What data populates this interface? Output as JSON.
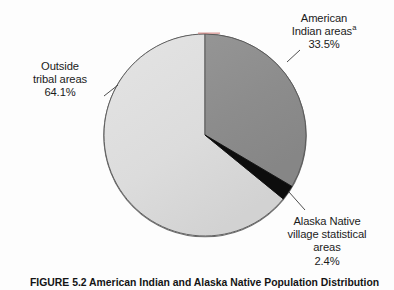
{
  "figure": {
    "caption": "FIGURE 5.2   American Indian and Alaska Native Population Distribution",
    "background_color": "#fdfdfd"
  },
  "chart_data": {
    "type": "pie",
    "title": "",
    "start_angle_deg": 0,
    "direction": "clockwise",
    "center": {
      "x": 205,
      "y": 135
    },
    "radius": 101,
    "categories": [
      "American Indian areasᵃ",
      "Alaska Native village statistical areas",
      "Outside tribal areas"
    ],
    "values": [
      33.5,
      2.4,
      64.1
    ],
    "unit": "%",
    "colors": [
      "#8e8e8e",
      "#0d0d0d",
      "#dcdcdc"
    ],
    "stroke_color": "#4a4a4a",
    "legend_position": "callout-labels",
    "grid": false,
    "slices": [
      {
        "name": "American Indian areas",
        "superscript": "a",
        "value": 33.5,
        "value_label": "33.5%",
        "color": "#8e8e8e",
        "label_lines": [
          "American",
          "Indian areas",
          "33.5%"
        ]
      },
      {
        "name": "Alaska Native village statistical areas",
        "superscript": "",
        "value": 2.4,
        "value_label": "2.4%",
        "color": "#0d0d0d",
        "label_lines": [
          "Alaska Native",
          "village statistical",
          "areas",
          "2.4%"
        ]
      },
      {
        "name": "Outside tribal areas",
        "superscript": "",
        "value": 64.1,
        "value_label": "64.1%",
        "color": "#dcdcdc",
        "label_lines": [
          "Outside",
          "tribal areas",
          "64.1%"
        ]
      }
    ]
  },
  "labels": {
    "american_indian": {
      "line1": "American",
      "line2": "Indian areas",
      "superscript": "a",
      "line3": "33.5%"
    },
    "outside_tribal": {
      "line1": "Outside",
      "line2": "tribal areas",
      "line3": "64.1%"
    },
    "alaska_native": {
      "line1": "Alaska Native",
      "line2": "village statistical",
      "line3": "areas",
      "line4": "2.4%"
    }
  }
}
